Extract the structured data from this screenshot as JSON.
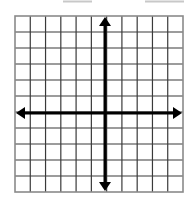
{
  "diagram": {
    "type": "coordinate-plane",
    "grid": {
      "columns": 11,
      "rows": 11,
      "left": 15,
      "right": 183,
      "top": 16,
      "bottom": 192,
      "line_color": "#3a3a3a",
      "border_color": "#8a8a8a"
    },
    "axes": {
      "x_axis_row_index": 6,
      "y_axis_col_index": 6,
      "x_axis_y": 113,
      "y_axis_x": 105,
      "color": "#000000",
      "stroke_width": 3,
      "arrows": [
        "up",
        "down",
        "left",
        "right"
      ]
    },
    "top_marks": [
      {
        "x1": 63,
        "x2": 92,
        "y": 1.5
      },
      {
        "x1": 145,
        "x2": 184,
        "y": 1.5
      }
    ],
    "top_mark_color": "#c8c8c8"
  }
}
